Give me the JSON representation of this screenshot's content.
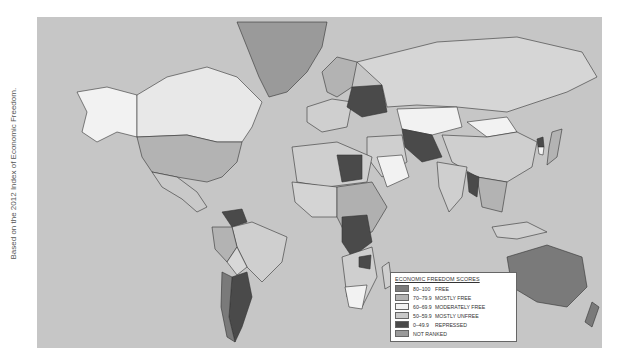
{
  "credit": "Based on the 2012 Index of Economic Freedom.",
  "legend": {
    "title": "ECONOMIC FREEDOM SCORES",
    "items": [
      {
        "range": "80–100",
        "label": "FREE",
        "color": "#7a7a7a"
      },
      {
        "range": "70–79.9",
        "label": "MOSTLY FREE",
        "color": "#b3b3b3"
      },
      {
        "range": "60–69.9",
        "label": "MODERATELY FREE",
        "color": "#f2f2f2"
      },
      {
        "range": "50–59.9",
        "label": "MOSTLY UNFREE",
        "color": "#c9c9c9"
      },
      {
        "range": "0–49.9",
        "label": "REPRESSED",
        "color": "#4a4a4a"
      },
      {
        "range": "",
        "label": "NOT RANKED",
        "color": "#9a9a9a"
      }
    ]
  },
  "colors": {
    "ocean": "#c6c6c6",
    "free": "#7a7a7a",
    "mostly_free": "#b3b3b3",
    "moderately_free": "#f2f2f2",
    "mostly_unfree": "#cfcfcf",
    "repressed": "#4a4a4a",
    "not_ranked": "#9a9a9a"
  }
}
